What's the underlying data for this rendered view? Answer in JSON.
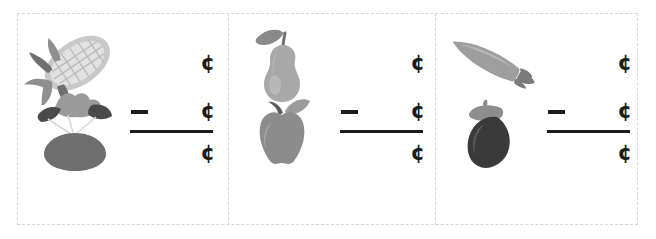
{
  "worksheet": {
    "background_color": "#ffffff",
    "border_color": "#d6d6d6",
    "ink_color": "#1b1b1b",
    "panel_count": 3
  },
  "symbols": {
    "cent": "¢",
    "minus": "–"
  },
  "problems": [
    {
      "id": "problem-1",
      "top_item": {
        "name": "corn",
        "icon": "corn-icon",
        "colors": {
          "cob": "#c9c9c9",
          "kernels": "#e2e2e2",
          "husk": "#8f8f8f",
          "husk_dark": "#6f6f6f"
        }
      },
      "bottom_item": {
        "name": "beet",
        "icon": "beet-icon",
        "colors": {
          "root": "#6e6e6e",
          "leaf_light": "#9a9a9a",
          "leaf_dark": "#4a4a4a",
          "stem": "#d8d8d8"
        }
      },
      "minuend_unit": "¢",
      "subtrahend_unit": "¢",
      "answer_unit": "¢",
      "operator": "–"
    },
    {
      "id": "problem-2",
      "top_item": {
        "name": "pear",
        "icon": "pear-icon",
        "colors": {
          "body": "#a8a8a8",
          "highlight": "#c4c4c4",
          "leaf": "#8a8a8a",
          "stem": "#707070"
        }
      },
      "bottom_item": {
        "name": "apple",
        "icon": "apple-icon",
        "colors": {
          "body": "#8c8c8c",
          "highlight": "#a5a5a5",
          "leaf": "#9c9c9c",
          "stem": "#5a5a5a"
        }
      },
      "minuend_unit": "¢",
      "subtrahend_unit": "¢",
      "answer_unit": "¢",
      "operator": "–"
    },
    {
      "id": "problem-3",
      "top_item": {
        "name": "carrot",
        "icon": "carrot-icon",
        "colors": {
          "body": "#9e9e9e",
          "highlight": "#b8b8b8",
          "top": "#7a7a7a"
        }
      },
      "bottom_item": {
        "name": "eggplant",
        "icon": "eggplant-icon",
        "colors": {
          "body": "#3a3a3a",
          "highlight": "#575757",
          "cap": "#8e8e8e"
        }
      },
      "minuend_unit": "¢",
      "subtrahend_unit": "¢",
      "answer_unit": "¢",
      "operator": "–"
    }
  ]
}
